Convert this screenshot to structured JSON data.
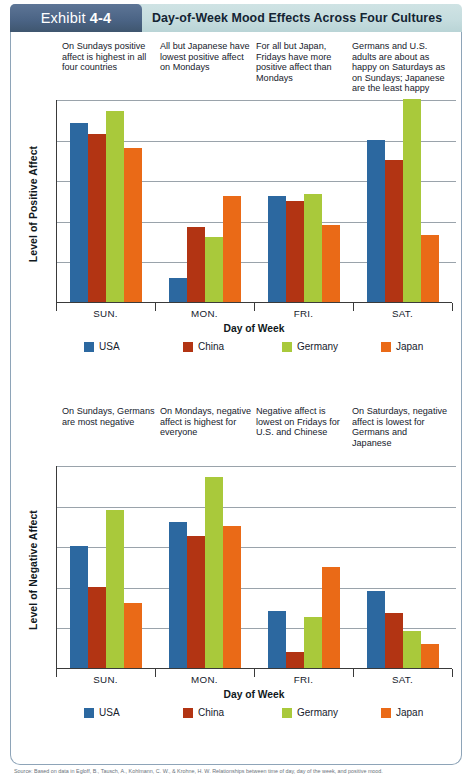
{
  "header": {
    "exhibit_word": "Exhibit",
    "exhibit_number": "4-4",
    "title": "Day-of-Week Mood Effects Across Four Cultures"
  },
  "notes_positive": [
    "On Sundays positive affect is highest in all four countries",
    "All but Japanese have lowest positive affect on Mondays",
    "For all but Japan, Fridays have more positive affect than Mondays",
    "Germans and U.S. adults are about as happy on Saturdays as on Sundays; Japanese are the least happy"
  ],
  "notes_negative": [
    "On Sundays, Germans are most negative",
    "On Mondays, negative affect is highest for everyone",
    "Negative affect is lowest on Fridays for U.S. and Chinese",
    "On Saturdays, negative affect is lowest for Germans and Japanese"
  ],
  "legend": [
    {
      "label": "USA",
      "color": "#2c68a0",
      "key": "usa"
    },
    {
      "label": "China",
      "color": "#b23413",
      "key": "china"
    },
    {
      "label": "Germany",
      "color": "#a9c93b",
      "key": "germany"
    },
    {
      "label": "Japan",
      "color": "#ea6a17",
      "key": "japan"
    }
  ],
  "axis": {
    "x_title": "Day of Week",
    "y_title_positive": "Level of Positive Affect",
    "y_title_negative": "Level of Negative Affect",
    "categories": [
      "SUN.",
      "MON.",
      "FRI.",
      "SAT."
    ]
  },
  "source": "Source: Based on data in Egloff, B., Tausch, A., Kohlmann, C. W., & Krohne, H. W. Relationships between time of day, day of the week, and positive mood.",
  "chart_data": [
    {
      "type": "bar",
      "title": "",
      "ylabel": "Level of Positive Affect",
      "xlabel": "Day of Week",
      "categories": [
        "SUN.",
        "MON.",
        "FRI.",
        "SAT."
      ],
      "ylim": [
        0,
        100
      ],
      "grid": true,
      "gridlines": [
        20,
        40,
        60,
        80,
        100
      ],
      "legend_position": "bottom",
      "series": [
        {
          "name": "USA",
          "color": "#2c68a0",
          "values": [
            88,
            12,
            52,
            80
          ]
        },
        {
          "name": "China",
          "color": "#b23413",
          "values": [
            83,
            37,
            50,
            70
          ]
        },
        {
          "name": "Germany",
          "color": "#a9c93b",
          "values": [
            94,
            32,
            53,
            100
          ]
        },
        {
          "name": "Japan",
          "color": "#ea6a17",
          "values": [
            76,
            52,
            38,
            33
          ]
        }
      ]
    },
    {
      "type": "bar",
      "title": "",
      "ylabel": "Level of Negative Affect",
      "xlabel": "Day of Week",
      "categories": [
        "SUN.",
        "MON.",
        "FRI.",
        "SAT."
      ],
      "ylim": [
        0,
        100
      ],
      "grid": true,
      "gridlines": [
        20,
        40,
        60,
        80,
        100
      ],
      "legend_position": "bottom",
      "series": [
        {
          "name": "USA",
          "color": "#2c68a0",
          "values": [
            60,
            72,
            28,
            38
          ]
        },
        {
          "name": "China",
          "color": "#b23413",
          "values": [
            40,
            65,
            8,
            27
          ]
        },
        {
          "name": "Germany",
          "color": "#a9c93b",
          "values": [
            78,
            94,
            25,
            18
          ]
        },
        {
          "name": "Japan",
          "color": "#ea6a17",
          "values": [
            32,
            70,
            50,
            12
          ]
        }
      ]
    }
  ]
}
